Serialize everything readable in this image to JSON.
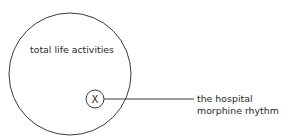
{
  "diagram": {
    "outer_circle": {
      "label": "total life activities",
      "cx": 70,
      "cy": 74,
      "r": 61
    },
    "inner_circle": {
      "label": "X",
      "cx": 95,
      "cy": 99,
      "r": 9
    },
    "connector": {
      "x1": 104,
      "y1": 99,
      "x2": 194,
      "y2": 99
    },
    "callout": {
      "line1": "the hospital",
      "line2": "morphine rhythm"
    },
    "colors": {
      "stroke": "#333333",
      "text": "#2a2a2a",
      "background": "#ffffff"
    }
  }
}
